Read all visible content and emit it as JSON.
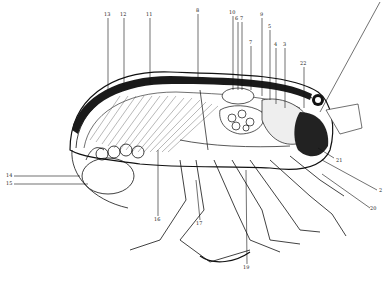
{
  "figure": {
    "labels": [
      {
        "id": "13",
        "text": "13",
        "x": 106,
        "y": 14
      },
      {
        "id": "12",
        "text": "12",
        "x": 122,
        "y": 14
      },
      {
        "id": "11",
        "text": "11",
        "x": 148,
        "y": 14
      },
      {
        "id": "8",
        "text": "8",
        "x": 197,
        "y": 10
      },
      {
        "id": "10",
        "text": "10",
        "x": 231,
        "y": 12
      },
      {
        "id": "6",
        "text": "6",
        "x": 236,
        "y": 17
      },
      {
        "id": "7",
        "text": "7",
        "x": 240,
        "y": 17
      },
      {
        "id": "9",
        "text": "9",
        "x": 261,
        "y": 14
      },
      {
        "id": "5",
        "text": "5",
        "x": 269,
        "y": 26
      },
      {
        "id": "4a",
        "text": "4",
        "x": 274,
        "y": 44
      },
      {
        "id": "3",
        "text": "3",
        "x": 283,
        "y": 44
      },
      {
        "id": "7b",
        "text": "7",
        "x": 249,
        "y": 41
      },
      {
        "id": "22",
        "text": "22",
        "x": 302,
        "y": 63
      },
      {
        "id": "14",
        "text": "14",
        "x": 8,
        "y": 174
      },
      {
        "id": "15",
        "text": "15",
        "x": 8,
        "y": 182
      },
      {
        "id": "16",
        "text": "16",
        "x": 156,
        "y": 218
      },
      {
        "id": "17",
        "text": "17",
        "x": 198,
        "y": 222
      },
      {
        "id": "19",
        "text": "19",
        "x": 245,
        "y": 267
      },
      {
        "id": "21",
        "text": "21",
        "x": 336,
        "y": 160
      },
      {
        "id": "2",
        "text": "2",
        "x": 379,
        "y": 190
      },
      {
        "id": "20",
        "text": "20",
        "x": 372,
        "y": 208
      }
    ]
  }
}
